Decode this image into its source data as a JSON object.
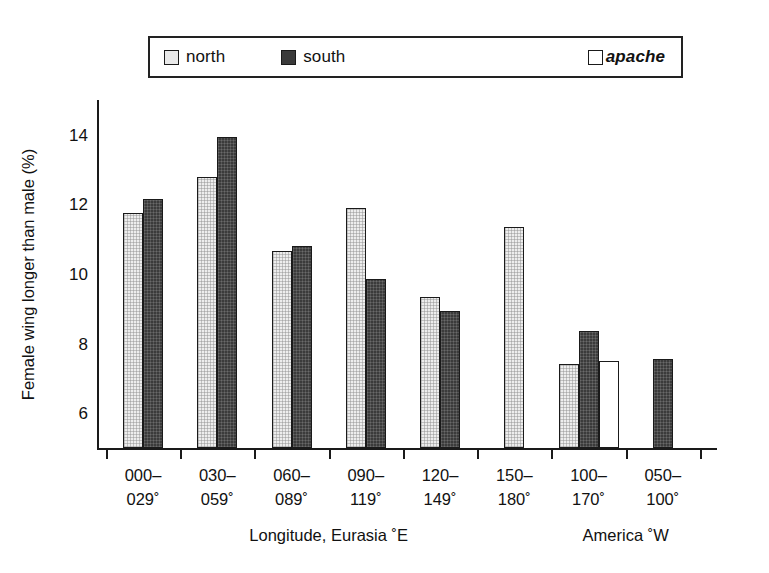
{
  "legend": {
    "items": [
      {
        "key": "north",
        "label": "north",
        "swatch": "light-gray-square",
        "color": "#e9e9e9"
      },
      {
        "key": "south",
        "label": "south",
        "swatch": "dark-gray-square",
        "color": "#3a3a3a"
      },
      {
        "key": "apache",
        "label": "apache",
        "swatch": "white-square",
        "color": "#ffffff",
        "italic": true
      }
    ]
  },
  "axes": {
    "ylabel": "Female wing longer than male (%)",
    "yticks": [
      "6",
      "8",
      "10",
      "12",
      "14"
    ],
    "section_labels": [
      "Longitude, Eurasia ˚E",
      "America ˚W"
    ]
  },
  "chart_data": {
    "type": "bar",
    "title": "",
    "xlabel": "Longitude, Eurasia ˚E / America ˚W",
    "ylabel": "Female wing longer than male (%)",
    "ylim": [
      5.0,
      15.0
    ],
    "yticks": [
      6,
      8,
      10,
      12,
      14
    ],
    "grid": false,
    "legend_position": "top",
    "categories": [
      "000–029˚",
      "030–059˚",
      "060–089˚",
      "090–119˚",
      "120–149˚",
      "150–180˚",
      "100–170˚",
      "050–100˚"
    ],
    "category_lines": [
      [
        "000–",
        "029˚"
      ],
      [
        "030–",
        "059˚"
      ],
      [
        "060–",
        "089˚"
      ],
      [
        "090–",
        "119˚"
      ],
      [
        "120–",
        "149˚"
      ],
      [
        "150–",
        "180˚"
      ],
      [
        "100–",
        "170˚"
      ],
      [
        "050–",
        "100˚"
      ]
    ],
    "sections": [
      {
        "label": "Longitude, Eurasia ˚E",
        "categories": [
          0,
          1,
          2,
          3,
          4,
          5
        ]
      },
      {
        "label": "America ˚W",
        "categories": [
          6,
          7
        ]
      }
    ],
    "series": [
      {
        "name": "north",
        "color": "#e9e9e9",
        "values": [
          11.75,
          12.8,
          10.65,
          11.9,
          9.35,
          11.35,
          7.4,
          null
        ]
      },
      {
        "name": "south",
        "color": "#3a3a3a",
        "values": [
          12.15,
          13.95,
          10.8,
          9.85,
          8.95,
          null,
          8.35,
          7.55
        ]
      },
      {
        "name": "apache",
        "color": "#ffffff",
        "values": [
          null,
          null,
          null,
          null,
          null,
          null,
          7.5,
          null
        ]
      }
    ]
  }
}
